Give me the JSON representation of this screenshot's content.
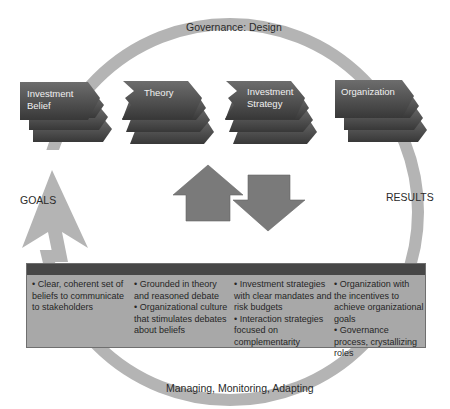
{
  "title_top": "Governance: Design",
  "title_bottom": "Managing, Monitoring, Adapting",
  "left_label": "GOALS",
  "right_label": "RESULTS",
  "stages": [
    {
      "label_line1": "Investment",
      "label_line2": "Belief"
    },
    {
      "label_line1": "Theory",
      "label_line2": ""
    },
    {
      "label_line1": "Investment",
      "label_line2": "Strategy"
    },
    {
      "label_line1": "Organization",
      "label_line2": ""
    }
  ],
  "panel": {
    "columns": [
      {
        "bullets": [
          "• Clear, coherent set of beliefs to communicate to stakeholders"
        ]
      },
      {
        "bullets": [
          "• Grounded in theory and reasoned debate",
          "• Organizational culture that stimulates debates about beliefs"
        ]
      },
      {
        "bullets": [
          "• Investment strategies with clear mandates and risk budgets",
          "• Interaction strategies focused on complementarity"
        ]
      },
      {
        "bullets": [
          "• Organization with the incentives to achieve organizational goals",
          "• Governance process, crystallizing roles"
        ]
      }
    ]
  },
  "colors": {
    "ring": "#b4b4b4",
    "card_dark": "#3c3c3c",
    "card_light": "#6a6a6a",
    "arrow": "#7a7a7a",
    "panel_body": "#a8a8a8",
    "panel_head": "#474747"
  }
}
